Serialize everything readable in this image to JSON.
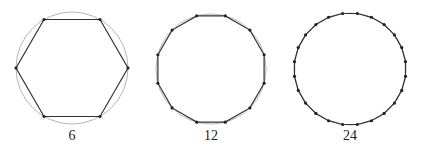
{
  "figures": [
    {
      "sides": 6,
      "label": "6",
      "cx": 72,
      "cy": 68,
      "r": 56,
      "rotation_deg": 0
    },
    {
      "sides": 12,
      "label": "12",
      "cx": 211,
      "cy": 69,
      "r": 55,
      "rotation_deg": 15
    },
    {
      "sides": 24,
      "label": "24",
      "cx": 350,
      "cy": 69,
      "r": 56,
      "rotation_deg": 7.5
    }
  ],
  "colors": {
    "circle": "#b5b5b5",
    "polygon": "#333333",
    "vertex": "#222222"
  }
}
